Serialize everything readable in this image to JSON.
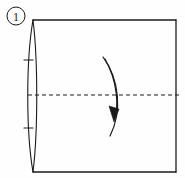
{
  "figure": {
    "kind": "origami-fold-diagram",
    "step_label": "1",
    "step_label_style": "circled-numeral",
    "background_color": "#fefefe",
    "ink_color": "#1a1a1a",
    "width": 185,
    "height": 178
  },
  "step_badge": {
    "label": "1",
    "center_x": 16,
    "center_y": 16,
    "radius": 9
  },
  "paper": {
    "name": "square-sheet",
    "top_edge": {
      "x1": 33,
      "y1": 20,
      "x2": 176,
      "y2": 20
    },
    "right_edge": {
      "x1": 176,
      "y1": 20,
      "x2": 176,
      "y2": 172
    },
    "bottom_edge": {
      "x1": 33,
      "y1": 172,
      "x2": 176,
      "y2": 172
    },
    "left_edge_style": "curled-rolled-edge",
    "left_edge_outer_curve": "M 33 20 C 26 60, 26 132, 33 172",
    "left_edge_inner_curve": "M 33 20 C 38 60, 38 132, 33 172",
    "left_edge_leftmost_x": 27
  },
  "tick_marks": [
    {
      "name": "left-edge-tick-upper",
      "x1": 24,
      "y1": 60,
      "x2": 33,
      "y2": 60
    },
    {
      "name": "left-edge-tick-lower",
      "x1": 24,
      "y1": 128,
      "x2": 33,
      "y2": 128
    }
  ],
  "fold_line": {
    "name": "horizontal-fold-crease",
    "style": "dashed",
    "x1": 28,
    "y1": 95,
    "x2": 180,
    "y2": 95,
    "dash_pattern": "4 3",
    "stroke_width": 1
  },
  "fold_arrow": {
    "name": "fold-direction-arrow",
    "direction": "downward-curving",
    "outer_stroke": "M 103 57 C 120 80, 122 112, 110 136",
    "inner_stroke": "M 105 59 C 118 82, 119 108, 114 118",
    "arrowhead": {
      "points": "114 122, 109 106, 119 109",
      "fill": "#1a1a1a"
    },
    "start_point": {
      "x": 103,
      "y": 57
    },
    "end_point": {
      "x": 114,
      "y": 122
    }
  }
}
